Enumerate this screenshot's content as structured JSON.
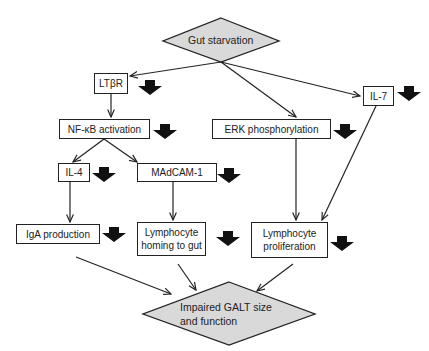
{
  "diagram": {
    "type": "flowchart",
    "colors": {
      "diamond_fill": "#d9d9d9",
      "stroke": "#222222",
      "down_arrow": "#111111"
    },
    "start": {
      "id": "gut-starvation",
      "label": "Gut starvation",
      "shape": "diamond"
    },
    "end": {
      "id": "impaired-galt",
      "label_line1": "Impaired GALT size",
      "label_line2": "and function",
      "shape": "diamond"
    },
    "nodes": {
      "ltbr": {
        "label": "LTβR",
        "decreased": true
      },
      "nfkb": {
        "label": "NF-κB activation",
        "decreased": true
      },
      "erk": {
        "label": "ERK phosphorylation",
        "decreased": true
      },
      "il7": {
        "label": "IL-7",
        "decreased": true
      },
      "il4": {
        "label": "IL-4",
        "decreased": true
      },
      "madcam": {
        "label": "MAdCAM-1",
        "decreased": true
      },
      "iga": {
        "label": "IgA production",
        "decreased": true
      },
      "homing": {
        "label_line1": "Lymphocyte",
        "label_line2": "homing to gut",
        "decreased": true
      },
      "prolif": {
        "label_line1": "Lymphocyte",
        "label_line2": "proliferation",
        "decreased": true
      }
    },
    "edges": [
      [
        "gut-starvation",
        "ltbr"
      ],
      [
        "gut-starvation",
        "erk"
      ],
      [
        "gut-starvation",
        "il7"
      ],
      [
        "ltbr",
        "nfkb"
      ],
      [
        "nfkb",
        "il4"
      ],
      [
        "nfkb",
        "madcam"
      ],
      [
        "il4",
        "iga"
      ],
      [
        "madcam",
        "homing"
      ],
      [
        "erk",
        "prolif"
      ],
      [
        "il7",
        "prolif"
      ],
      [
        "iga",
        "impaired-galt"
      ],
      [
        "homing",
        "impaired-galt"
      ],
      [
        "prolif",
        "impaired-galt"
      ]
    ]
  }
}
